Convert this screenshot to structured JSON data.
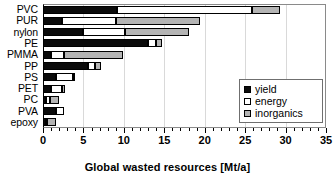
{
  "chart_data": {
    "type": "bar",
    "orientation": "horizontal",
    "stacked": true,
    "title": "",
    "xlabel": "Global wasted resources [Mt/a]",
    "ylabel": "",
    "xlim": [
      0,
      35
    ],
    "xticks": [
      0,
      5,
      10,
      15,
      20,
      25,
      30,
      35
    ],
    "xticklabels": [
      "0",
      "5",
      "10",
      "15",
      "20",
      "25",
      "30",
      "35"
    ],
    "minor_tick_interval": 1,
    "grid": "vertical-major",
    "legend_position": "center-right",
    "categories": [
      "PVC",
      "PUR",
      "nylon",
      "PE",
      "PMMA",
      "PP",
      "PS",
      "PET",
      "PC",
      "PVA",
      "epoxy"
    ],
    "series": [
      {
        "name": "yield",
        "color": "#0b0b0b",
        "values": [
          9.2,
          2.4,
          5.0,
          13.0,
          1.0,
          5.6,
          1.6,
          1.0,
          0.4,
          1.6,
          0.4
        ]
      },
      {
        "name": "energy",
        "color": "#ffffff",
        "values": [
          16.7,
          6.6,
          5.1,
          1.0,
          1.6,
          0.8,
          2.1,
          1.3,
          0.5,
          1.0,
          0.1
        ]
      },
      {
        "name": "inorganics",
        "color": "#b4b4b4",
        "values": [
          3.4,
          10.4,
          8.0,
          0.7,
          7.3,
          0.8,
          0.1,
          0.4,
          1.1,
          0.0,
          1.1
        ]
      }
    ],
    "totals": [
      29.3,
      19.4,
      18.1,
      14.7,
      9.9,
      7.2,
      3.8,
      2.7,
      2.0,
      2.6,
      1.6
    ]
  },
  "legend": {
    "entries": [
      {
        "label": "yield",
        "swatch": "filled-black-square"
      },
      {
        "label": "energy",
        "swatch": "open-white-square"
      },
      {
        "label": "inorganics",
        "swatch": "gray-square"
      }
    ]
  }
}
